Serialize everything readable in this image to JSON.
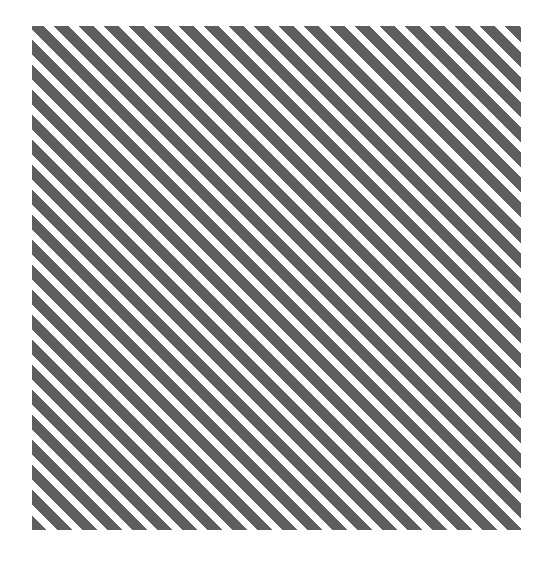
{
  "figure": {
    "kind": "diagonal-stripe-pattern",
    "page_background_color": "#ffffff",
    "has_text": false,
    "has_border": false
  },
  "swatch": {
    "name": "striped-square",
    "x": 32,
    "y": 26,
    "width": 489,
    "height": 504,
    "background_color": "#ffffff"
  },
  "pattern": {
    "type": "diagonal-stripes",
    "angle_degrees": 45,
    "direction": "lower-left to upper-right",
    "stripe_color": "#5e5e5e",
    "gap_color": "#ffffff",
    "horizontal_period_px": 25,
    "perpendicular_period_px": 17.7,
    "stripe_width_px": 10.6,
    "gap_width_px": 7.1,
    "stripe_count_along_top": 20,
    "clipped_at_edges": true
  }
}
